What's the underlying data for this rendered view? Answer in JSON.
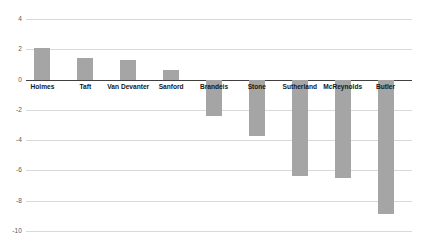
{
  "chart_data": {
    "type": "bar",
    "title": "",
    "subtitle": "",
    "xlabel": "",
    "ylabel": "",
    "categories": [
      "Holmes",
      "Taft",
      "Van Devanter",
      "Sanford",
      "Brandeis",
      "Stone",
      "Sutherland",
      "McReynolds",
      "Butler"
    ],
    "values": [
      2.1,
      1.4,
      1.3,
      0.6,
      -2.4,
      -3.7,
      -6.4,
      -6.5,
      -8.9
    ],
    "series": [
      {
        "name": "",
        "values": [
          2.1,
          1.4,
          1.3,
          0.6,
          -2.4,
          -3.7,
          -6.4,
          -6.5,
          -8.9
        ]
      }
    ],
    "ylim": [
      -10,
      4
    ],
    "yticks": [
      4,
      2,
      0,
      -2,
      -4,
      -6,
      -8,
      -10
    ],
    "ytick_labels": [
      "4",
      "2",
      "0",
      "-2",
      "-4",
      "-6",
      "-8",
      "-10"
    ],
    "grid": true,
    "legend": false,
    "legend_position": "none",
    "bar_color": "#a5a5a5",
    "gridline_color": "#d9d9d9",
    "zero_line_color": "#404040",
    "background_color": "#ffffff",
    "annotations": []
  }
}
